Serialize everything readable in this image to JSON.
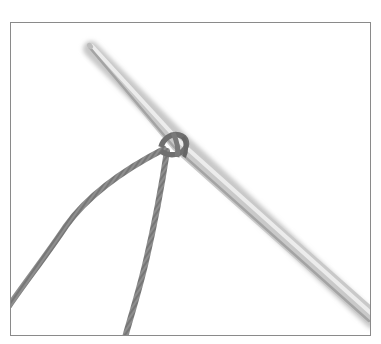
{
  "image": {
    "subject": "knitting-needle-with-slip-knot",
    "colors": {
      "background": "#ffffff",
      "frame_border": "#8a8a8a",
      "needle_light": "#e6e6e6",
      "needle_dark": "#a9a9a9",
      "yarn": "#8c8c8c",
      "yarn_dark": "#6f6f6f"
    }
  }
}
